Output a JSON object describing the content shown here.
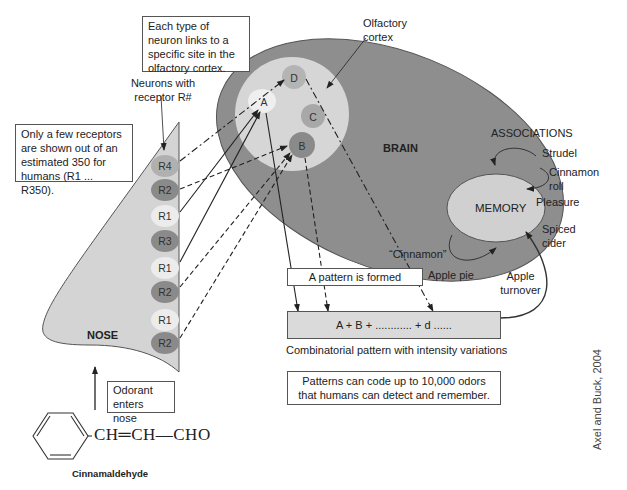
{
  "callouts": {
    "neuron_links": "Each type of neuron links to a specific site in the olfactory cortex.",
    "neurons_with_receptor": "Neurons with receptor R#",
    "receptors_note": "Only a few receptors are shown out of an estimated 350 for humans (R1 ... R350).",
    "olfactory_cortex": "Olfactory cortex",
    "odorant_enters": "Odorant enters nose",
    "pattern_formed": "A pattern is formed",
    "patterns_code": "Patterns can code up to 10,000 odors that humans can detect and remember."
  },
  "nose": {
    "label": "NOSE",
    "receptors": [
      "R4",
      "R2",
      "R1",
      "R3",
      "R1",
      "R2",
      "R1",
      "R2"
    ]
  },
  "brain": {
    "label": "BRAIN",
    "sites": [
      "A",
      "B",
      "C",
      "D"
    ]
  },
  "memory": {
    "label": "MEMORY",
    "associations_title": "ASSOCIATIONS",
    "associations": [
      "Strudel",
      "Cinnamon roll",
      "Pleasure",
      "Spiced cider",
      "Apple turnover",
      "Apple pie",
      "“Cinnamon”"
    ]
  },
  "pattern": {
    "formula": "A + B + ............ + d ......",
    "caption": "Combinatorial pattern with intensity variations"
  },
  "molecule": {
    "formula": "CH═CH—CHO",
    "name": "Cinnamaldehyde"
  },
  "credit": "Axel and Buck, 2004",
  "colors": {
    "brain": "#8e8e8e",
    "cortex": "#d6d6d6",
    "nose": "#d4d4d4",
    "memory": "#dcdcdc",
    "receptor_dark": "#8a8a8a",
    "receptor_mid": "#b0b0b0",
    "receptor_light": "#ececec"
  }
}
